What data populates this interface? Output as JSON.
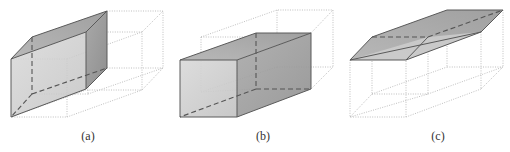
{
  "figure": {
    "panels": [
      {
        "id": "a",
        "label": "(a)",
        "description": "Prism sheared upward-right from reference cube (dotted ghost outlines)"
      },
      {
        "id": "b",
        "label": "(b)",
        "description": "Elongated rectangular prism (extended along depth) with dotted ghost"
      },
      {
        "id": "c",
        "label": "(c)",
        "description": "Flattened slab (compressed height) with dotted ghost of original box"
      }
    ],
    "colors": {
      "face_light": "#d6d6d6",
      "face_mid": "#bdbdbd",
      "face_dark": "#9a9a9a",
      "edge": "#5a5a5a",
      "ghost": "#b8b8b8"
    }
  }
}
